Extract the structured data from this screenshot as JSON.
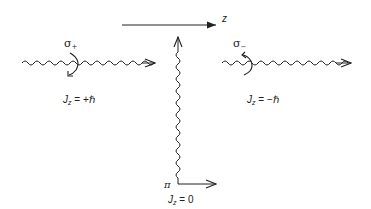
{
  "diagram": {
    "axis": {
      "label": "z",
      "direction": "right"
    },
    "photons": [
      {
        "id": "sigma_plus",
        "symbol": "σ",
        "subscript": "+",
        "jz_label": "J",
        "jz_sub": "z",
        "jz_value": "= +ℏ",
        "rotation": "clockwise",
        "direction": "right"
      },
      {
        "id": "sigma_minus",
        "symbol": "σ",
        "subscript": "−",
        "jz_label": "J",
        "jz_sub": "z",
        "jz_value": "= −ℏ",
        "rotation": "counterclockwise",
        "direction": "right"
      },
      {
        "id": "pi",
        "symbol": "π",
        "jz_label": "J",
        "jz_sub": "z",
        "jz_value": "= 0",
        "direction": "up"
      }
    ]
  },
  "colors": {
    "line": "#222222",
    "background": "#ffffff"
  }
}
